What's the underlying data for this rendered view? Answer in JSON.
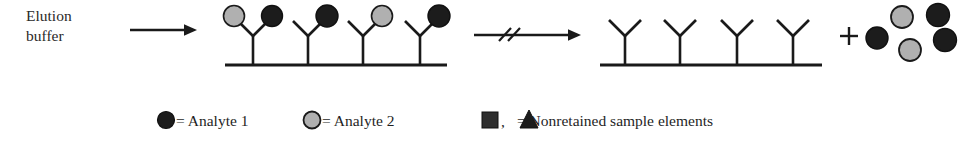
{
  "figure": {
    "width": 978,
    "height": 146,
    "background": "#ffffff",
    "elution_label_line1": "Elution",
    "elution_label_line2": "buffer"
  },
  "colors": {
    "stroke": "#1a1a1a",
    "analyte1_fill": "#1c1c1c",
    "analyte2_fill": "#b0b0b0",
    "text": "#1f1f1f",
    "background": "#ffffff"
  },
  "arrows": [
    {
      "name": "elution-arrow",
      "x1": 130,
      "y1": 30,
      "x2": 196,
      "y2": 30,
      "break_marks": false
    },
    {
      "name": "elapsed-time-arrow",
      "x1": 474,
      "y1": 35,
      "x2": 580,
      "y2": 35,
      "break_marks": true
    }
  ],
  "left_support": {
    "name": "left-support-surface",
    "x1": 225,
    "x2": 447,
    "y": 65,
    "antibodies": [
      {
        "stem_x": 253,
        "left_arm": "analyte2",
        "right_arm": "analyte1"
      },
      {
        "stem_x": 308,
        "left_arm": "empty",
        "right_arm": "analyte1"
      },
      {
        "stem_x": 363,
        "left_arm": "empty",
        "right_arm": "analyte2"
      },
      {
        "stem_x": 420,
        "left_arm": "empty",
        "right_arm": "analyte1"
      }
    ]
  },
  "right_support": {
    "name": "right-support-surface",
    "x1": 600,
    "x2": 822,
    "y": 65,
    "antibodies": [
      {
        "stem_x": 625,
        "left_arm": "empty",
        "right_arm": "empty"
      },
      {
        "stem_x": 680,
        "left_arm": "empty",
        "right_arm": "empty"
      },
      {
        "stem_x": 737,
        "left_arm": "empty",
        "right_arm": "empty"
      },
      {
        "stem_x": 793,
        "left_arm": "empty",
        "right_arm": "empty"
      }
    ]
  },
  "plus_sign": {
    "name": "plus-sign",
    "x": 848,
    "y": 36,
    "label": "+"
  },
  "released_particles": [
    {
      "cx": 902,
      "cy": 17,
      "type": "analyte2"
    },
    {
      "cx": 938,
      "cy": 15,
      "type": "analyte1"
    },
    {
      "cx": 877,
      "cy": 38,
      "type": "analyte1"
    },
    {
      "cx": 945,
      "cy": 40,
      "type": "analyte1"
    },
    {
      "cx": 910,
      "cy": 50,
      "type": "analyte2"
    }
  ],
  "legend": {
    "items": [
      {
        "symbol": "filled-circle",
        "symbol_type": "analyte1",
        "text": "= Analyte 1"
      },
      {
        "symbol": "gray-circle",
        "symbol_type": "analyte2",
        "text": "= Analyte 2"
      },
      {
        "symbol": "square-triangle",
        "symbol_type": "nonretained",
        "text": "= Nonretained sample elements"
      }
    ]
  }
}
